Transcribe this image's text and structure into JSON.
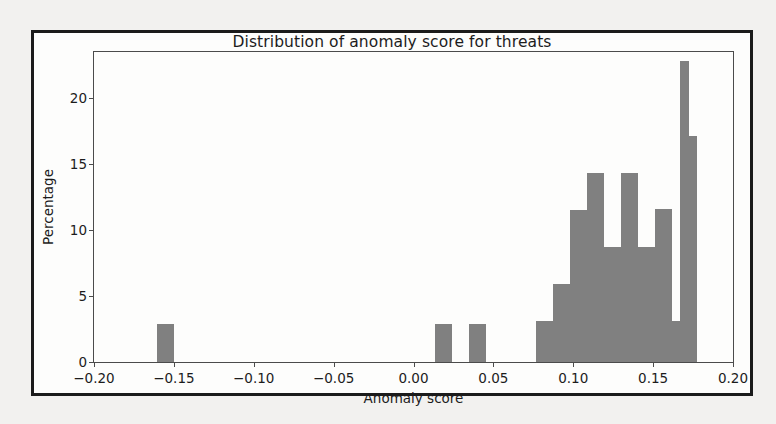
{
  "chart_data": {
    "type": "bar",
    "title": "Distribution of anomaly score for threats",
    "xlabel": "Anomaly score",
    "ylabel": "Percentage",
    "xlim": [
      -0.2,
      0.2
    ],
    "ylim": [
      0,
      23.5
    ],
    "grid": false,
    "legend": null,
    "bar_color": "#808080",
    "xticks": [
      -0.2,
      -0.15,
      -0.1,
      -0.05,
      0.0,
      0.05,
      0.1,
      0.15,
      0.2
    ],
    "xticklabels": [
      "−0.20",
      "−0.15",
      "−0.10",
      "−0.05",
      "0.00",
      "0.05",
      "0.10",
      "0.15",
      "0.20"
    ],
    "yticks": [
      0,
      5,
      10,
      15,
      20
    ],
    "yticklabels": [
      "0",
      "5",
      "10",
      "15",
      "20"
    ],
    "bin_width": 0.0106,
    "bins": [
      {
        "x0": -0.1605,
        "x1": -0.1499,
        "value": 2.9
      },
      {
        "x0": 0.0133,
        "x1": 0.0239,
        "value": 2.9
      },
      {
        "x0": 0.0345,
        "x1": 0.0451,
        "value": 2.9
      },
      {
        "x0": 0.0769,
        "x1": 0.0875,
        "value": 3.1
      },
      {
        "x0": 0.0875,
        "x1": 0.0981,
        "value": 5.9
      },
      {
        "x0": 0.0981,
        "x1": 0.1087,
        "value": 11.5
      },
      {
        "x0": 0.1087,
        "x1": 0.1193,
        "value": 14.3
      },
      {
        "x0": 0.1193,
        "x1": 0.1299,
        "value": 8.7
      },
      {
        "x0": 0.1299,
        "x1": 0.1405,
        "value": 14.3
      },
      {
        "x0": 0.1405,
        "x1": 0.1511,
        "value": 8.7
      },
      {
        "x0": 0.1458,
        "x1": 0.1564,
        "value": 3.1
      },
      {
        "x0": 0.1511,
        "x1": 0.1617,
        "value": 11.6
      },
      {
        "x0": 0.1617,
        "x1": 0.167,
        "value": 3.1
      },
      {
        "x0": 0.167,
        "x1": 0.1723,
        "value": 22.8
      },
      {
        "x0": 0.1723,
        "x1": 0.1776,
        "value": 17.1
      }
    ]
  }
}
